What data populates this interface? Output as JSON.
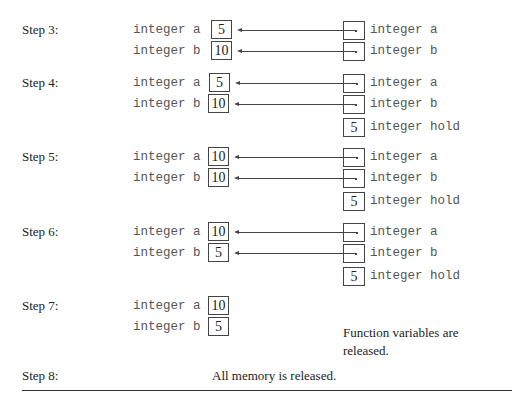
{
  "steps": [
    {
      "label": "Step 3:",
      "caller": [
        {
          "name": "integer a",
          "value": "5"
        },
        {
          "name": "integer b",
          "value": "10"
        }
      ],
      "function": [
        {
          "name": "integer a",
          "value": "",
          "reference": true
        },
        {
          "name": "integer b",
          "value": "",
          "reference": true
        }
      ]
    },
    {
      "label": "Step 4:",
      "caller": [
        {
          "name": "integer a",
          "value": "5"
        },
        {
          "name": "integer b",
          "value": "10"
        }
      ],
      "function": [
        {
          "name": "integer a",
          "value": "",
          "reference": true
        },
        {
          "name": "integer b",
          "value": "",
          "reference": true
        },
        {
          "name": "integer hold",
          "value": "5",
          "reference": false
        }
      ]
    },
    {
      "label": "Step 5:",
      "caller": [
        {
          "name": "integer a",
          "value": "10"
        },
        {
          "name": "integer b",
          "value": "10"
        }
      ],
      "function": [
        {
          "name": "integer a",
          "value": "",
          "reference": true
        },
        {
          "name": "integer b",
          "value": "",
          "reference": true
        },
        {
          "name": "integer hold",
          "value": "5",
          "reference": false
        }
      ]
    },
    {
      "label": "Step 6:",
      "caller": [
        {
          "name": "integer a",
          "value": "10"
        },
        {
          "name": "integer b",
          "value": "5"
        }
      ],
      "function": [
        {
          "name": "integer a",
          "value": "",
          "reference": true
        },
        {
          "name": "integer b",
          "value": "",
          "reference": true
        },
        {
          "name": "integer hold",
          "value": "5",
          "reference": false
        }
      ]
    },
    {
      "label": "Step 7:",
      "caller": [
        {
          "name": "integer a",
          "value": "10"
        },
        {
          "name": "integer b",
          "value": "5"
        }
      ],
      "note_line1": "Function variables are",
      "note_line2": "released."
    },
    {
      "label": "Step 8:",
      "note": "All memory is released."
    }
  ],
  "colors": {
    "line": "#444444",
    "text": "#222222",
    "mono_text": "#555555"
  }
}
